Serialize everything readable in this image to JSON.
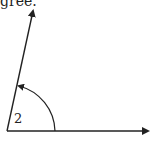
{
  "caption": {
    "text": "gree."
  },
  "diagram": {
    "type": "angle",
    "label": "2",
    "vertex": [
      7,
      131
    ],
    "ray_initial_end": [
      150,
      131
    ],
    "ray_terminal_end": [
      33,
      9
    ],
    "arc": {
      "start": [
        55,
        131
      ],
      "end": [
        18,
        86
      ],
      "direction": "counterclockwise"
    },
    "stroke_color": "#222222"
  }
}
